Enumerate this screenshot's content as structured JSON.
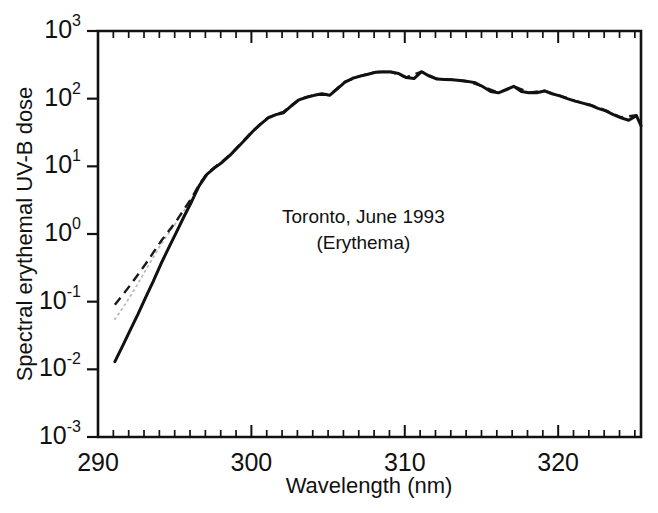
{
  "chart_data": {
    "type": "line",
    "title": "",
    "xlabel": "Wavelength (nm)",
    "ylabel": "Spectral erythemal UV-B dose",
    "xlim": [
      290,
      325.4
    ],
    "ylim": [
      0.001,
      1000
    ],
    "yscale": "log",
    "xscale": "linear",
    "grid": false,
    "legend_position": "none",
    "xticks": [
      290,
      300,
      310,
      320
    ],
    "xticklabels": [
      "290",
      "300",
      "310",
      "320"
    ],
    "xminor_tick_step": 1,
    "yticks": [
      0.001,
      0.01,
      0.1,
      1,
      10,
      100,
      1000
    ],
    "yticklabels": [
      "10-3",
      "10-2",
      "10-1",
      "100",
      "101",
      "102",
      "103"
    ],
    "ytick_mantissa": "10",
    "ytick_exponents": [
      "-3",
      "-2",
      "-1",
      "0",
      "1",
      "2",
      "3"
    ],
    "annotations": [
      {
        "name": "location-date",
        "text": "Toronto, June 1993",
        "x": 307.3,
        "y": 1.75
      },
      {
        "name": "action-spectrum",
        "text": "(Erythema)",
        "x": 307.3,
        "y": 0.72
      }
    ],
    "series": [
      {
        "name": "measured",
        "style": "solid",
        "color": "#111111",
        "x": [
          291.1,
          291.6,
          292.1,
          292.6,
          293.1,
          293.6,
          294.1,
          294.6,
          295.1,
          295.6,
          296.1,
          296.6,
          297.1,
          297.6,
          298.1,
          298.6,
          299.1,
          299.6,
          300.1,
          300.6,
          301.1,
          301.6,
          302.1,
          302.6,
          303.1,
          303.6,
          304.1,
          304.6,
          305.1,
          305.6,
          306.1,
          306.6,
          307.1,
          307.6,
          308.1,
          308.6,
          309.1,
          309.6,
          310.1,
          310.6,
          311.1,
          311.6,
          312.1,
          312.6,
          313.1,
          313.6,
          314.1,
          314.6,
          315.1,
          315.6,
          316.1,
          316.6,
          317.1,
          317.6,
          318.1,
          318.6,
          319.1,
          319.6,
          320.1,
          320.6,
          321.1,
          321.6,
          322.1,
          322.6,
          323.1,
          323.6,
          324.1,
          324.6,
          325.1,
          325.4
        ],
        "y": [
          0.013,
          0.022,
          0.038,
          0.065,
          0.115,
          0.2,
          0.36,
          0.62,
          1.05,
          1.8,
          3.0,
          5.2,
          7.6,
          9.5,
          11.5,
          14.5,
          19.0,
          25.0,
          33.0,
          42.0,
          52.0,
          58.0,
          62.0,
          78.0,
          96.0,
          105.0,
          112.0,
          118.0,
          112.0,
          140.0,
          175.0,
          200.0,
          215.0,
          230.0,
          245.0,
          250.0,
          248.0,
          235.0,
          205.0,
          198.0,
          250.0,
          215.0,
          195.0,
          192.0,
          190.0,
          186.0,
          180.0,
          172.0,
          150.0,
          128.0,
          122.0,
          135.0,
          152.0,
          128.0,
          122.0,
          122.0,
          130.0,
          118.0,
          110.0,
          100.0,
          92.0,
          86.0,
          80.0,
          72.0,
          66.0,
          58.0,
          52.0,
          48.0,
          56.0,
          40.0
        ]
      },
      {
        "name": "model-dashed",
        "style": "dashed",
        "color": "#1a1a1a",
        "x": [
          291.1,
          291.6,
          292.1,
          292.6,
          293.1,
          293.6,
          294.1,
          294.6,
          295.1,
          295.6,
          296.1,
          296.6,
          297.1,
          297.6,
          298.1,
          298.6,
          299.1,
          299.6,
          300.1,
          301.1,
          302.1,
          303.1,
          304.1,
          305.1,
          306.1,
          307.1,
          308.1,
          309.1,
          310.1,
          311.1,
          312.1,
          313.1,
          314.1,
          315.1,
          316.1,
          317.1,
          318.1,
          319.1,
          320.1,
          321.1,
          322.1,
          323.1,
          324.1,
          325.1,
          325.4
        ],
        "y": [
          0.09,
          0.125,
          0.175,
          0.25,
          0.36,
          0.53,
          0.78,
          1.1,
          1.55,
          2.3,
          3.4,
          5.4,
          7.8,
          9.7,
          11.8,
          14.8,
          19.4,
          25.5,
          33.5,
          53.0,
          64.0,
          98.0,
          114.0,
          114.0,
          178.0,
          217.0,
          247.0,
          249.0,
          207.0,
          250.0,
          197.0,
          191.0,
          181.0,
          151.0,
          123.0,
          153.0,
          123.0,
          131.0,
          111.0,
          93.0,
          81.0,
          67.0,
          53.0,
          57.0,
          40.5
        ]
      },
      {
        "name": "model-dotted",
        "style": "dotted",
        "color": "#b8b8b8",
        "x": [
          291.1,
          291.6,
          292.1,
          292.6,
          293.1,
          293.6,
          294.1,
          294.6,
          295.1,
          295.6,
          296.1
        ],
        "y": [
          0.055,
          0.08,
          0.12,
          0.185,
          0.29,
          0.45,
          0.7,
          1.02,
          1.48,
          2.2,
          3.3
        ]
      }
    ]
  },
  "figure": {
    "plot_left_nm": 290,
    "plot_right_nm": 325.4,
    "caption": ""
  }
}
